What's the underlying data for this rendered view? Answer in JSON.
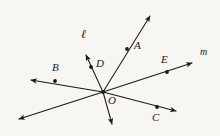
{
  "figure": {
    "background_color": "#f7f6f2",
    "ink_color": "#1a1a1a",
    "width": 220,
    "height": 136,
    "center_point": {
      "label": "O",
      "x": 103,
      "y": 92
    },
    "point_labels": [
      {
        "name": "A",
        "label": "A",
        "label_x": 134,
        "label_y": 46,
        "dot_x": 127,
        "dot_y": 49
      },
      {
        "name": "B",
        "label": "B",
        "label_x": 52,
        "label_y": 66,
        "dot_x": 55,
        "dot_y": 81
      },
      {
        "name": "C",
        "label": "C",
        "label_x": 152,
        "label_y": 118,
        "dot_x": 157,
        "dot_y": 107
      },
      {
        "name": "D",
        "label": "D",
        "label_x": 96,
        "label_y": 62,
        "dot_x": 91,
        "dot_y": 67
      },
      {
        "name": "E",
        "label": "E",
        "label_x": 161,
        "label_y": 58,
        "dot_x": 167,
        "dot_y": 72
      },
      {
        "name": "O",
        "label": "O",
        "label_x": 108,
        "label_y": 99,
        "dot_x": 103,
        "dot_y": 92
      }
    ],
    "line_labels": [
      {
        "name": "line-l",
        "label": "ℓ",
        "label_x": 84,
        "label_y": 34
      },
      {
        "name": "line-m",
        "label": "m",
        "label_x": 200,
        "label_y": 51
      }
    ],
    "rays": [
      {
        "name": "ray-OA",
        "from": [
          103,
          92
        ],
        "to": [
          152,
          13
        ],
        "arrow": true
      },
      {
        "name": "ray-OD",
        "from": [
          103,
          92
        ],
        "to": [
          85,
          52
        ],
        "arrow": true
      },
      {
        "name": "ray-O-down",
        "from": [
          103,
          92
        ],
        "to": [
          113,
          128
        ],
        "arrow": true
      },
      {
        "name": "ray-OB",
        "from": [
          103,
          92
        ],
        "to": [
          27,
          79
        ],
        "arrow": true
      },
      {
        "name": "ray-OE",
        "from": [
          103,
          92
        ],
        "to": [
          196,
          62
        ],
        "arrow": true
      },
      {
        "name": "ray-OC",
        "from": [
          103,
          92
        ],
        "to": [
          180,
          112
        ],
        "arrow": true
      },
      {
        "name": "ray-O-lowerleft",
        "from": [
          103,
          92
        ],
        "to": [
          15,
          120
        ],
        "arrow": true
      }
    ]
  }
}
